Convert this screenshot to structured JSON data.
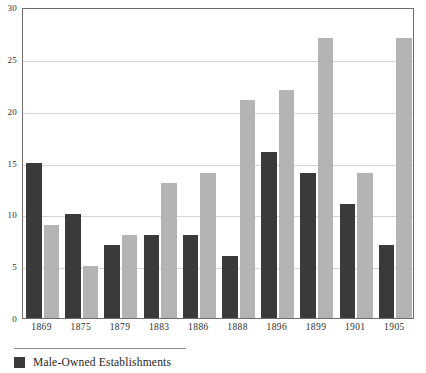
{
  "chart_data": {
    "type": "bar",
    "title": "",
    "subtitle": "",
    "xlabel": "",
    "ylabel": "",
    "categories": [
      "1869",
      "1875",
      "1879",
      "1883",
      "1886",
      "1888",
      "1896",
      "1899",
      "1901",
      "1905"
    ],
    "series": [
      {
        "name": "Male-Owned Establishments",
        "color": "#3a3a3a",
        "values": [
          15,
          10,
          7,
          8,
          8,
          6,
          16,
          14,
          11,
          7
        ]
      },
      {
        "name": "",
        "color": "#b4b4b4",
        "values": [
          9,
          5,
          8,
          13,
          14,
          21,
          22,
          27,
          14,
          27
        ]
      }
    ],
    "ylim": [
      0,
      30
    ],
    "yticks": [
      0,
      5,
      10,
      15,
      20,
      25,
      30
    ],
    "ytick_labels": [
      "0",
      "5",
      "10",
      "15",
      "20",
      "25",
      "30"
    ],
    "grid": true,
    "grid_axis": "y",
    "legend_position": "bottom-left",
    "legend_entries": [
      {
        "label": "Male-Owned Establishments",
        "color": "#3a3a3a"
      }
    ]
  },
  "colors": {
    "series_dark": "#3a3a3a",
    "series_light": "#b4b4b4",
    "gridline": "#d4d4d4",
    "axis": "#6d6d6d",
    "text": "#2f2f2f",
    "background": "#ffffff"
  }
}
